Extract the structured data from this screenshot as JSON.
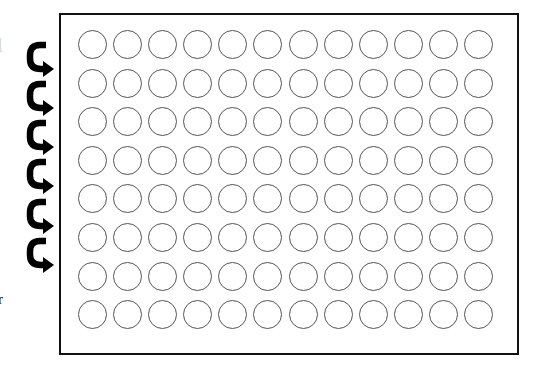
{
  "figure": {
    "type": "microplate-loading-diagram",
    "plate": {
      "rows": 8,
      "columns": 12,
      "well_count": 96,
      "well_style": "empty-circle",
      "border_color": "#111111",
      "well_outline_color": "#555555"
    },
    "arrows": {
      "count": 6,
      "direction": "serpentine-down-then-right",
      "color": "#000000",
      "tips_y": [
        72,
        110,
        150,
        190,
        230,
        268
      ]
    },
    "cropped_text": {
      "top_fragment": "l",
      "bottom_fragment": "r"
    }
  }
}
